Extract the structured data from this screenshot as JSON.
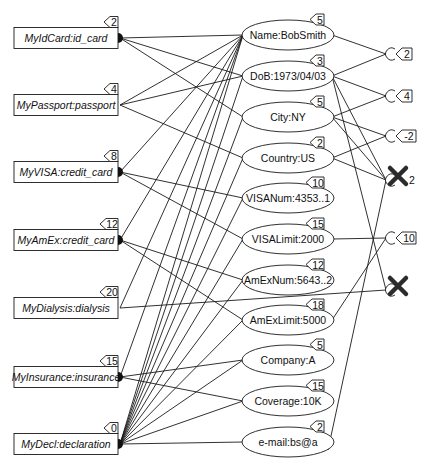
{
  "diagram": {
    "type": "entity-attribute-graph",
    "entities": [
      {
        "id": "e0",
        "label": "MyIdCard:id_card",
        "tag": "2"
      },
      {
        "id": "e1",
        "label": "MyPassport:passport",
        "tag": "4"
      },
      {
        "id": "e2",
        "label": "MyVISA:credit_card",
        "tag": "8"
      },
      {
        "id": "e3",
        "label": "MyAmEx:credit_card",
        "tag": "12"
      },
      {
        "id": "e4",
        "label": "MyDialysis:dialysis",
        "tag": "20"
      },
      {
        "id": "e5",
        "label": "MyInsurance:insurance",
        "tag": "15"
      },
      {
        "id": "e6",
        "label": "MyDecl:declaration",
        "tag": "0"
      }
    ],
    "attributes": [
      {
        "id": "a0",
        "label": "Name:BobSmith",
        "tag": "5"
      },
      {
        "id": "a1",
        "label": "DoB:1973/04/03",
        "tag": "3"
      },
      {
        "id": "a2",
        "label": "City:NY",
        "tag": "5"
      },
      {
        "id": "a3",
        "label": "Country:US",
        "tag": "2"
      },
      {
        "id": "a4",
        "label": "VISANum:4353..1",
        "tag": "10"
      },
      {
        "id": "a5",
        "label": "VISALimit:2000",
        "tag": "15"
      },
      {
        "id": "a6",
        "label": "AmExNum:5643..2",
        "tag": "12"
      },
      {
        "id": "a7",
        "label": "AmExLimit:5000",
        "tag": "18"
      },
      {
        "id": "a8",
        "label": "Company:A",
        "tag": "5"
      },
      {
        "id": "a9",
        "label": "Coverage:10K",
        "tag": "15"
      },
      {
        "id": "a10",
        "label": "e-mail:bs@a",
        "tag": "2"
      }
    ],
    "constraints": [
      {
        "id": "c0",
        "tag": "2",
        "violated": false
      },
      {
        "id": "c1",
        "tag": "4",
        "violated": false
      },
      {
        "id": "c2",
        "tag": "-2",
        "violated": false
      },
      {
        "id": "c3",
        "tag": "2",
        "violated": true
      },
      {
        "id": "c4",
        "tag": "10",
        "violated": false
      },
      {
        "id": "c5",
        "tag": "",
        "violated": true
      }
    ],
    "entity_attribute_edges": [
      [
        "e0",
        "a0"
      ],
      [
        "e0",
        "a1"
      ],
      [
        "e0",
        "a2"
      ],
      [
        "e1",
        "a0"
      ],
      [
        "e1",
        "a1"
      ],
      [
        "e1",
        "a3"
      ],
      [
        "e2",
        "a4"
      ],
      [
        "e2",
        "a5"
      ],
      [
        "e2",
        "a0"
      ],
      [
        "e3",
        "a6"
      ],
      [
        "e3",
        "a7"
      ],
      [
        "e3",
        "a0"
      ],
      [
        "e4",
        "a0"
      ],
      [
        "e5",
        "a8"
      ],
      [
        "e5",
        "a9"
      ],
      [
        "e5",
        "a0"
      ],
      [
        "e6",
        "a0"
      ],
      [
        "e6",
        "a1"
      ],
      [
        "e6",
        "a2"
      ],
      [
        "e6",
        "a3"
      ],
      [
        "e6",
        "a4"
      ],
      [
        "e6",
        "a5"
      ],
      [
        "e6",
        "a6"
      ],
      [
        "e6",
        "a7"
      ],
      [
        "e6",
        "a8"
      ],
      [
        "e6",
        "a9"
      ],
      [
        "e6",
        "a10"
      ]
    ],
    "attribute_constraint_edges": [
      [
        "a0",
        "c0"
      ],
      [
        "a1",
        "c0"
      ],
      [
        "a1",
        "c1"
      ],
      [
        "a2",
        "c1"
      ],
      [
        "a2",
        "c2"
      ],
      [
        "a3",
        "c2"
      ],
      [
        "a2",
        "c3"
      ],
      [
        "a3",
        "c3"
      ],
      [
        "a1",
        "c3"
      ],
      [
        "a5",
        "c4"
      ],
      [
        "a7",
        "c4"
      ],
      [
        "a1",
        "c5"
      ],
      [
        "a10",
        "c3"
      ]
    ],
    "entity_constraint_edges": [
      [
        "e4",
        "c5"
      ]
    ],
    "colors": {
      "stroke": "#1a1a1a",
      "fill": "#ffffff",
      "violation_mark": "#2b2b2b"
    }
  }
}
